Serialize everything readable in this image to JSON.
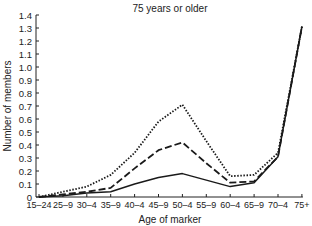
{
  "chart_data": {
    "type": "line",
    "title": "75 years or older",
    "xlabel": "Age of marker",
    "ylabel": "Number of members",
    "categories": [
      "15–24",
      "25–9",
      "30–4",
      "35–9",
      "40–4",
      "45–9",
      "50–4",
      "55–9",
      "60–4",
      "65–9",
      "70–4",
      "75+"
    ],
    "ylim": [
      0,
      1.4
    ],
    "yticks": [
      0,
      0.1,
      0.2,
      0.3,
      0.4,
      0.5,
      0.6,
      0.7,
      0.8,
      0.9,
      1.0,
      1.1,
      1.2,
      1.3,
      1.4
    ],
    "ytick_labels": [
      "0",
      "0.1",
      "0.2",
      "0.3",
      "0.4",
      "0.5",
      "0.6",
      "0.7",
      "0.8",
      "0.9",
      "1.0",
      "1.1",
      "1.2",
      "1.3",
      "1.4"
    ],
    "grid": false,
    "legend": null,
    "series": [
      {
        "name": "dotted",
        "style": "dotted",
        "values": [
          0.0,
          0.04,
          0.08,
          0.17,
          0.34,
          0.58,
          0.71,
          0.43,
          0.16,
          0.17,
          0.34,
          1.31
        ]
      },
      {
        "name": "dashed",
        "style": "dashed",
        "values": [
          0.0,
          0.02,
          0.04,
          0.07,
          0.22,
          0.36,
          0.42,
          0.26,
          0.11,
          0.12,
          0.31,
          1.31
        ]
      },
      {
        "name": "solid",
        "style": "solid",
        "values": [
          0.0,
          0.01,
          0.03,
          0.04,
          0.1,
          0.15,
          0.18,
          0.13,
          0.08,
          0.11,
          0.31,
          1.31
        ]
      }
    ]
  }
}
